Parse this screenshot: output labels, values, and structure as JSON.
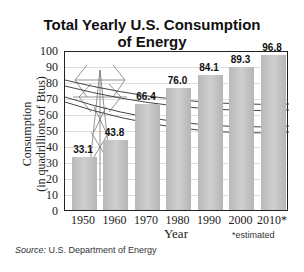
{
  "chart_data": {
    "type": "bar",
    "title": "Total Yearly U.S. Consumption of Energy",
    "title_lines": [
      "Total Yearly U.S. Consumption",
      "of Energy"
    ],
    "categories": [
      "1950",
      "1960",
      "1970",
      "1980",
      "1990",
      "2000",
      "2010*"
    ],
    "values": [
      33.1,
      43.8,
      66.4,
      76.0,
      84.1,
      89.3,
      96.8
    ],
    "value_labels": [
      "33.1",
      "43.8",
      "66.4",
      "76.0",
      "84.1",
      "89.3",
      "96.8"
    ],
    "xlabel": "Year",
    "ylabel": "Consumption (in quadrillions of Btus)",
    "ylabel_lines": [
      "Consumption",
      "(in quadrillions of Btus)"
    ],
    "ylim": [
      0,
      100
    ],
    "yticks": [
      "0",
      "10",
      "20",
      "30",
      "40",
      "50",
      "60",
      "70",
      "80",
      "90",
      "100"
    ],
    "grid": true,
    "annotations": [
      "*estimated"
    ],
    "bar_color": "#c4c4c4"
  },
  "footer": {
    "source_label": "Source:",
    "source_text": " U.S. Department of Energy"
  }
}
